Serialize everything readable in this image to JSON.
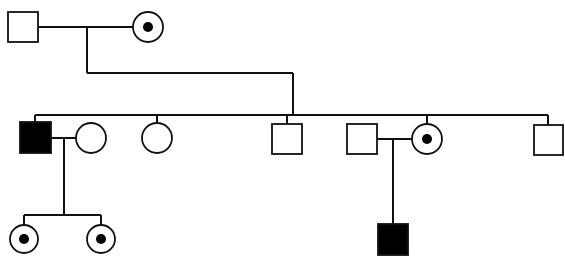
{
  "legend_meaning": {
    "square": "male",
    "circle": "female",
    "filled": "affected",
    "dot": "carrier",
    "open": "unaffected"
  },
  "colors": {
    "line": "#111111",
    "affected": "#000000",
    "background": "#ffffff"
  },
  "generations": [
    {
      "label": "I",
      "individuals": [
        {
          "id": "I-1",
          "sex": "male",
          "status": "unaffected"
        },
        {
          "id": "I-2",
          "sex": "female",
          "status": "carrier"
        }
      ]
    },
    {
      "label": "II",
      "individuals": [
        {
          "id": "II-1",
          "sex": "male",
          "status": "affected",
          "child_of": "I-1 x I-2"
        },
        {
          "id": "II-2",
          "sex": "female",
          "status": "unaffected",
          "spouse_of": "II-1"
        },
        {
          "id": "II-3",
          "sex": "female",
          "status": "unaffected",
          "child_of": "I-1 x I-2"
        },
        {
          "id": "II-4",
          "sex": "male",
          "status": "unaffected",
          "child_of": "I-1 x I-2"
        },
        {
          "id": "II-5",
          "sex": "male",
          "status": "unaffected",
          "spouse_of": "II-6"
        },
        {
          "id": "II-6",
          "sex": "female",
          "status": "carrier",
          "child_of": "I-1 x I-2"
        },
        {
          "id": "II-7",
          "sex": "male",
          "status": "unaffected",
          "child_of": "I-1 x I-2"
        }
      ]
    },
    {
      "label": "III",
      "individuals": [
        {
          "id": "III-1",
          "sex": "female",
          "status": "carrier",
          "child_of": "II-1 x II-2"
        },
        {
          "id": "III-2",
          "sex": "female",
          "status": "carrier",
          "child_of": "II-1 x II-2"
        },
        {
          "id": "III-3",
          "sex": "male",
          "status": "affected",
          "child_of": "II-5 x II-6"
        }
      ]
    }
  ]
}
